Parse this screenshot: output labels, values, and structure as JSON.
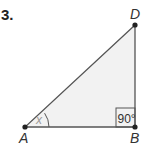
{
  "problem": {
    "number": "3."
  },
  "diagram": {
    "type": "right-triangle",
    "vertices": [
      {
        "name": "A",
        "label": "A"
      },
      {
        "name": "B",
        "label": "B"
      },
      {
        "name": "D",
        "label": "D"
      }
    ],
    "right_angle": {
      "vertex": "B",
      "label": "90°"
    },
    "angle_at_A": {
      "label": "x"
    },
    "colors": {
      "fill": "#f2f2f2",
      "stroke": "#555555",
      "point": "#222222",
      "angle_label": "#999999"
    }
  }
}
